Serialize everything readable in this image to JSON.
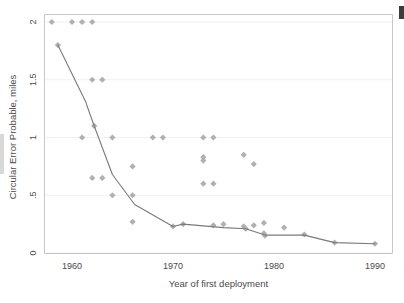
{
  "chart_data": {
    "type": "scatter",
    "title": "",
    "xlabel": "Year of first deployment",
    "ylabel": "Circular Error Probable, miles",
    "xlim": [
      1957,
      1991
    ],
    "ylim": [
      0,
      2
    ],
    "xticks": [
      1960,
      1970,
      1980,
      1990
    ],
    "xtick_labels": [
      "1960",
      "1970",
      "1980",
      "1990"
    ],
    "yticks": [
      0,
      0.5,
      1,
      1.5,
      2
    ],
    "ytick_labels": [
      "0",
      ".5",
      "1",
      "1.5",
      "2"
    ],
    "grid": "horizontal",
    "legend": "none",
    "marker_color": "#b0b0b0",
    "line_color": "#7a7a7a",
    "grid_color": "#f0f0f0",
    "axis_color": "#c8c8c8",
    "series": [
      {
        "name": "Missile systems",
        "type": "scatter",
        "points": [
          [
            1958.0,
            2.0
          ],
          [
            1960.0,
            2.0
          ],
          [
            1961.0,
            2.0
          ],
          [
            1962.0,
            2.0
          ],
          [
            1958.6,
            1.8
          ],
          [
            1962.0,
            1.5
          ],
          [
            1963.0,
            1.5
          ],
          [
            1962.2,
            1.1
          ],
          [
            1961.0,
            1.0
          ],
          [
            1964.0,
            1.0
          ],
          [
            1968.0,
            1.0
          ],
          [
            1969.0,
            1.0
          ],
          [
            1973.0,
            1.0
          ],
          [
            1974.0,
            1.0
          ],
          [
            1973.0,
            0.83
          ],
          [
            1973.0,
            0.8
          ],
          [
            1977.0,
            0.85
          ],
          [
            1978.0,
            0.77
          ],
          [
            1966.0,
            0.75
          ],
          [
            1962.0,
            0.65
          ],
          [
            1963.0,
            0.65
          ],
          [
            1973.0,
            0.6
          ],
          [
            1974.0,
            0.6
          ],
          [
            1964.0,
            0.5
          ],
          [
            1966.0,
            0.5
          ],
          [
            1966.0,
            0.27
          ],
          [
            1970.0,
            0.23
          ],
          [
            1971.0,
            0.25
          ],
          [
            1974.0,
            0.24
          ],
          [
            1975.0,
            0.25
          ],
          [
            1977.0,
            0.23
          ],
          [
            1977.2,
            0.21
          ],
          [
            1978.0,
            0.24
          ],
          [
            1979.0,
            0.26
          ],
          [
            1979.0,
            0.17
          ],
          [
            1979.1,
            0.15
          ],
          [
            1981.0,
            0.22
          ],
          [
            1983.0,
            0.16
          ],
          [
            1986.0,
            0.09
          ],
          [
            1990.0,
            0.08
          ]
        ]
      },
      {
        "name": "Trend line",
        "type": "line",
        "points": [
          [
            1958.6,
            1.8
          ],
          [
            1961.4,
            1.3
          ],
          [
            1961.5,
            1.27
          ],
          [
            1962.2,
            1.1
          ],
          [
            1964.0,
            0.68
          ],
          [
            1966.2,
            0.42
          ],
          [
            1970.0,
            0.23
          ],
          [
            1971.0,
            0.25
          ],
          [
            1975.0,
            0.22
          ],
          [
            1977.2,
            0.21
          ],
          [
            1979.1,
            0.155
          ],
          [
            1983.0,
            0.155
          ],
          [
            1986.0,
            0.09
          ],
          [
            1990.0,
            0.08
          ]
        ]
      }
    ]
  }
}
